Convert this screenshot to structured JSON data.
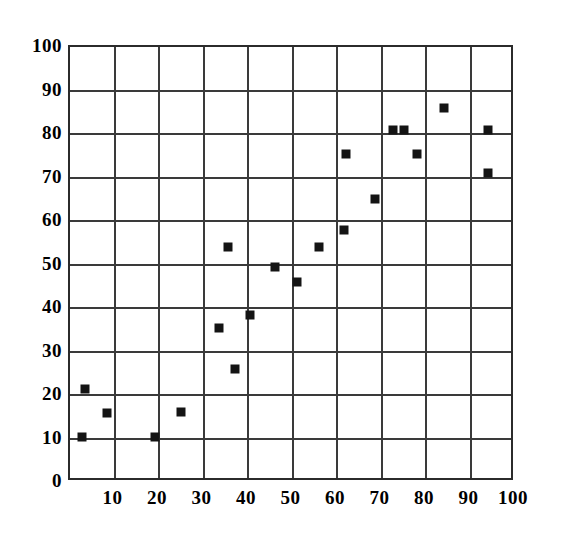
{
  "chart_data": {
    "type": "scatter",
    "title": "",
    "subtitle": "",
    "xlabel": "",
    "ylabel": "",
    "xlim": [
      0,
      100
    ],
    "ylim": [
      0,
      100
    ],
    "grid": true,
    "legend": null,
    "legend_position": "none",
    "annotations": [],
    "marker": {
      "shape": "square",
      "color": "#141414",
      "size_px": 9
    },
    "x_ticks": [
      10,
      20,
      30,
      40,
      50,
      60,
      70,
      80,
      90,
      100
    ],
    "x_tick_labels": [
      "10",
      "20",
      "30",
      "40",
      "50",
      "60",
      "70",
      "80",
      "90",
      "100"
    ],
    "y_ticks": [
      0,
      10,
      20,
      30,
      40,
      50,
      60,
      70,
      80,
      90,
      100
    ],
    "y_tick_labels": [
      "0",
      "10",
      "20",
      "30",
      "40",
      "50",
      "60",
      "70",
      "80",
      "90",
      "100"
    ],
    "x_gridlines": [
      0,
      10,
      20,
      30,
      40,
      50,
      60,
      70,
      80,
      90,
      100
    ],
    "y_gridlines": [
      0,
      10,
      20,
      30,
      40,
      50,
      60,
      70,
      80,
      90,
      100
    ],
    "n_points": 19,
    "points": [
      {
        "x": 2.8,
        "y": 10.3
      },
      {
        "x": 3.4,
        "y": 21.3
      },
      {
        "x": 8.4,
        "y": 15.9
      },
      {
        "x": 19.0,
        "y": 10.3
      },
      {
        "x": 25.0,
        "y": 16.0
      },
      {
        "x": 33.5,
        "y": 35.5
      },
      {
        "x": 35.5,
        "y": 54.0
      },
      {
        "x": 37.0,
        "y": 26.0
      },
      {
        "x": 40.5,
        "y": 38.5
      },
      {
        "x": 46.0,
        "y": 49.5
      },
      {
        "x": 51.0,
        "y": 46.0
      },
      {
        "x": 56.0,
        "y": 54.0
      },
      {
        "x": 61.5,
        "y": 58.0
      },
      {
        "x": 62.0,
        "y": 75.5
      },
      {
        "x": 68.5,
        "y": 65.0
      },
      {
        "x": 72.5,
        "y": 81.0
      },
      {
        "x": 75.0,
        "y": 81.0
      },
      {
        "x": 78.0,
        "y": 75.5
      },
      {
        "x": 84.0,
        "y": 86.0
      },
      {
        "x": 94.0,
        "y": 81.0
      },
      {
        "x": 94.0,
        "y": 71.0
      }
    ],
    "colors": {
      "marker": "#141414",
      "gridline": "#3a3a3a",
      "frame": "#2b2b2b",
      "background": "#ffffff",
      "text": "#000000"
    }
  }
}
